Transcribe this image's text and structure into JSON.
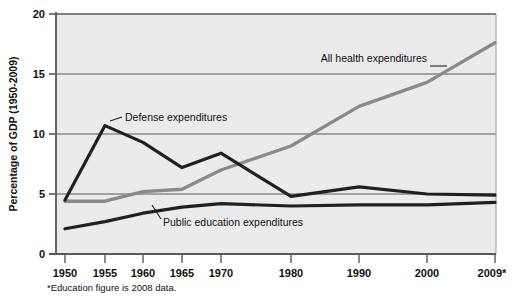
{
  "chart_data": {
    "type": "line",
    "title": "",
    "xlabel": "",
    "ylabel": "Percentage of GDP (1950-2009)",
    "ylim": [
      0,
      20
    ],
    "yticks": [
      0,
      5,
      10,
      15,
      20
    ],
    "ytick_labels": [
      "0",
      "5",
      "10",
      "15",
      "20"
    ],
    "grid": true,
    "legend_position": "inline-annotations",
    "categories": [
      "1950",
      "1955",
      "1960",
      "1965",
      "1970",
      "1980",
      "1990",
      "2000",
      "2009*"
    ],
    "x_values": [
      1950,
      1955,
      1960,
      1965,
      1970,
      1980,
      1990,
      2000,
      2009
    ],
    "series": [
      {
        "name": "Defense expenditures",
        "color": "#231f20",
        "values": [
          4.5,
          10.7,
          9.3,
          7.2,
          8.4,
          4.8,
          5.6,
          5.0,
          4.9
        ]
      },
      {
        "name": "All health expenditures",
        "color": "#8a8a8a",
        "values": [
          4.4,
          4.4,
          5.2,
          5.4,
          7.0,
          9.0,
          12.3,
          14.3,
          17.6
        ]
      },
      {
        "name": "Public education expenditures",
        "color": "#231f20",
        "values": [
          2.1,
          2.7,
          3.4,
          3.9,
          4.2,
          4.0,
          4.1,
          4.1,
          4.3
        ]
      }
    ],
    "annotations": [
      {
        "text": "Defense expenditures",
        "series": "Defense expenditures"
      },
      {
        "text": "All health expenditures",
        "series": "All health expenditures"
      },
      {
        "text": "Public education expenditures",
        "series": "Public education expenditures"
      }
    ],
    "footnote": "*Education figure is 2008 data."
  },
  "axis": {
    "y_title": "Percentage of GDP (1950-2009)",
    "y_tick_0": "0",
    "y_tick_5": "5",
    "y_tick_10": "10",
    "y_tick_15": "15",
    "y_tick_20": "20",
    "x_tick_1950": "1950",
    "x_tick_1955": "1955",
    "x_tick_1960": "1960",
    "x_tick_1965": "1965",
    "x_tick_1970": "1970",
    "x_tick_1980": "1980",
    "x_tick_1990": "1990",
    "x_tick_2000": "2000",
    "x_tick_2009": "2009*"
  },
  "labels": {
    "defense": "Defense expenditures",
    "health": "All health expenditures",
    "education": "Public education expenditures"
  },
  "footnote": {
    "text": "*Education figure is 2008 data."
  },
  "colors": {
    "plot_background": "#ebebeb",
    "gridline": "#58595b",
    "axis": "#58595b",
    "dark_series": "#231f20",
    "gray_series": "#8a8a8a",
    "page_background": "#ffffff"
  }
}
